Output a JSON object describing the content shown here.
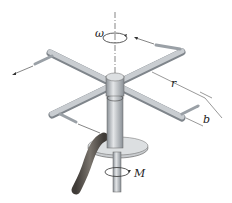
{
  "diagram": {
    "labels": {
      "omega": "ω",
      "r": "r",
      "b": "b",
      "M": "M"
    },
    "colors": {
      "rod": "#b9bdc2",
      "rod_dark": "#7f858b",
      "rod_light": "#e4e6e8",
      "disk": "#c9cccf",
      "hose": "#5f5a55",
      "line": "#333333"
    }
  }
}
